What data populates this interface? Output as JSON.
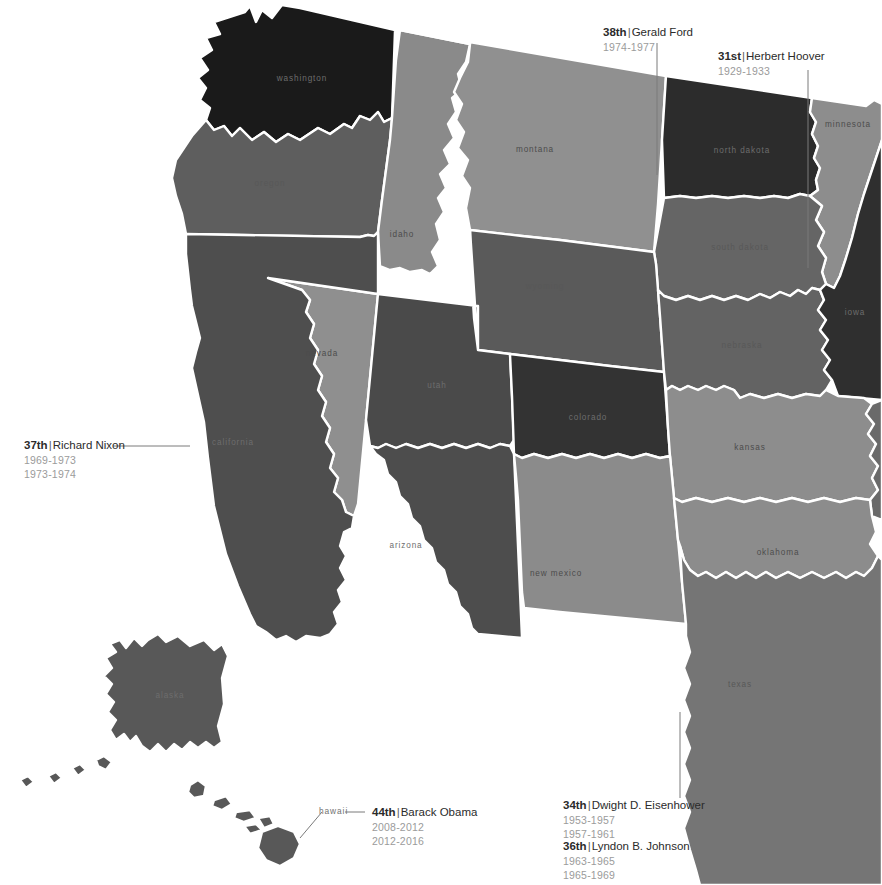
{
  "map": {
    "title": "Presidents by Home State — Western United States",
    "background_color": "#ffffff",
    "border_color": "#ffffff",
    "leader_line_color": "#7a7a7a"
  },
  "states": [
    {
      "id": "washington",
      "label": "washington",
      "fill": "#1a1a1a",
      "label_tone": "dark"
    },
    {
      "id": "oregon",
      "label": "oregon",
      "fill": "#5e5e5e",
      "label_tone": "mid"
    },
    {
      "id": "idaho",
      "label": "idaho",
      "fill": "#8a8a8a",
      "label_tone": "light"
    },
    {
      "id": "montana",
      "label": "montana",
      "fill": "#909090",
      "label_tone": "light"
    },
    {
      "id": "north-dakota",
      "label": "north dakota",
      "fill": "#2c2c2c",
      "label_tone": "dark"
    },
    {
      "id": "minnesota",
      "label": "minnesota",
      "fill": "#8d8d8d",
      "label_tone": "light"
    },
    {
      "id": "south-dakota",
      "label": "south dakota",
      "fill": "#656565",
      "label_tone": "mid"
    },
    {
      "id": "wyoming",
      "label": "wyoming",
      "fill": "#5a5a5a",
      "label_tone": "mid"
    },
    {
      "id": "nevada",
      "label": "nevada",
      "fill": "#8f8f8f",
      "label_tone": "light"
    },
    {
      "id": "california",
      "label": "california",
      "fill": "#4e4e4e",
      "label_tone": "dark"
    },
    {
      "id": "utah",
      "label": "utah",
      "fill": "#4a4a4a",
      "label_tone": "dark"
    },
    {
      "id": "colorado",
      "label": "colorado",
      "fill": "#333333",
      "label_tone": "dark"
    },
    {
      "id": "nebraska",
      "label": "nebraska",
      "fill": "#636363",
      "label_tone": "mid"
    },
    {
      "id": "iowa",
      "label": "iowa",
      "fill": "#2f2f2f",
      "label_tone": "dark"
    },
    {
      "id": "kansas",
      "label": "kansas",
      "fill": "#8d8d8d",
      "label_tone": "light"
    },
    {
      "id": "arizona",
      "label": "arizona",
      "fill": "#4d4d4d",
      "label_tone": "dark"
    },
    {
      "id": "new-mexico",
      "label": "new mexico",
      "fill": "#8b8b8b",
      "label_tone": "light"
    },
    {
      "id": "oklahoma",
      "label": "oklahoma",
      "fill": "#8c8c8c",
      "label_tone": "light"
    },
    {
      "id": "texas",
      "label": "texas",
      "fill": "#757575",
      "label_tone": "mid"
    },
    {
      "id": "missouri",
      "label": "missouri",
      "fill": "#6a6a6a",
      "label_tone": "mid"
    },
    {
      "id": "alaska",
      "label": "alaska",
      "fill": "#585858",
      "label_tone": "dark"
    },
    {
      "id": "hawaii",
      "label": "hawaii",
      "fill": "#585858",
      "label_tone": "dark"
    }
  ],
  "annotations": [
    {
      "id": "gerald-ford",
      "ordinal": "38th",
      "name": "Gerald Ford",
      "terms": [
        "1974-1977"
      ],
      "state": "north-dakota"
    },
    {
      "id": "herbert-hoover",
      "ordinal": "31st",
      "name": "Herbert Hoover",
      "terms": [
        "1929-1933"
      ],
      "state": "north-dakota"
    },
    {
      "id": "richard-nixon",
      "ordinal": "37th",
      "name": "Richard Nixon",
      "terms": [
        "1969-1973",
        "1973-1974"
      ],
      "state": "california"
    },
    {
      "id": "dwight-eisenhower",
      "ordinal": "34th",
      "name": "Dwight D. Eisenhower",
      "terms": [
        "1953-1957",
        "1957-1961"
      ],
      "state": "texas"
    },
    {
      "id": "lyndon-johnson",
      "ordinal": "36th",
      "name": "Lyndon B. Johnson",
      "terms": [
        "1963-1965",
        "1965-1969"
      ],
      "state": "texas"
    },
    {
      "id": "barack-obama",
      "ordinal": "44th",
      "name": "Barack Obama",
      "terms": [
        "2008-2012",
        "2012-2016"
      ],
      "state": "hawaii"
    }
  ],
  "callout_labels": {
    "hawaii_tag": "hawaii"
  }
}
